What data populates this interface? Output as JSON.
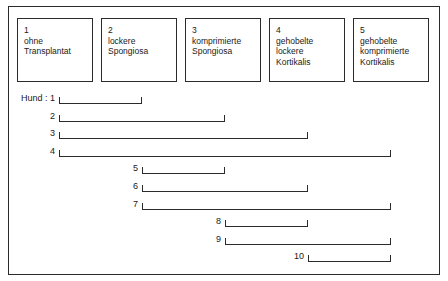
{
  "figure": {
    "frame_color": "#2b2b2b",
    "background": "#ffffff"
  },
  "legend": {
    "boxes": [
      {
        "number": "1",
        "description": "ohne\nTransplantat"
      },
      {
        "number": "2",
        "description": "lockere\nSpongiosa"
      },
      {
        "number": "3",
        "description": "komprimierte\nSpongiosa"
      },
      {
        "number": "4",
        "description": "gehobelte\nlockere\nKortikalis"
      },
      {
        "number": "5",
        "description": "gehobelte\nkomprimierte\nKortikalis"
      }
    ]
  },
  "chart_data": {
    "type": "bar",
    "title": "",
    "xlabel": "",
    "ylabel": "",
    "orientation": "horizontal",
    "grid": false,
    "legend_position": "top",
    "axis_stops": [
      1,
      2,
      3,
      4,
      5
    ],
    "categories": [
      "1",
      "2",
      "3",
      "4",
      "5",
      "6",
      "7",
      "8",
      "9",
      "10"
    ],
    "row_labels": [
      "Hund : 1",
      "2",
      "3",
      "4",
      "5",
      "6",
      "7",
      "8",
      "9",
      "10"
    ],
    "bars": [
      {
        "label": "Hund : 1",
        "start": 1,
        "end": 2
      },
      {
        "label": "2",
        "start": 1,
        "end": 3
      },
      {
        "label": "3",
        "start": 1,
        "end": 4
      },
      {
        "label": "4",
        "start": 1,
        "end": 5
      },
      {
        "label": "5",
        "start": 2,
        "end": 3
      },
      {
        "label": "6",
        "start": 2,
        "end": 4
      },
      {
        "label": "7",
        "start": 2,
        "end": 5
      },
      {
        "label": "8",
        "start": 3,
        "end": 4
      },
      {
        "label": "9",
        "start": 3,
        "end": 5
      },
      {
        "label": "10",
        "start": 4,
        "end": 5
      }
    ]
  }
}
